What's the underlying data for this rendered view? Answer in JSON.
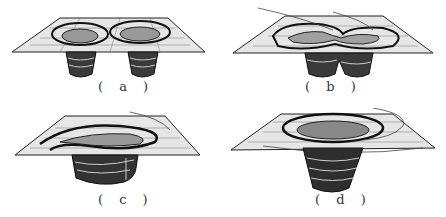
{
  "figure": {
    "panels": [
      {
        "id": "a",
        "label": "( a )",
        "description": "two separate vortex funnels through a plane"
      },
      {
        "id": "b",
        "label": "( b )",
        "description": "two vortices merging, connected loop on the plane"
      },
      {
        "id": "c",
        "label": "( c )",
        "description": "merged vortex with twisted spiral on plane"
      },
      {
        "id": "d",
        "label": "( d )",
        "description": "single large merged vortex funnel"
      }
    ],
    "colors": {
      "ink": "#1a1a1a",
      "plane": "#e8e8e8",
      "background": "#ffffff"
    }
  }
}
